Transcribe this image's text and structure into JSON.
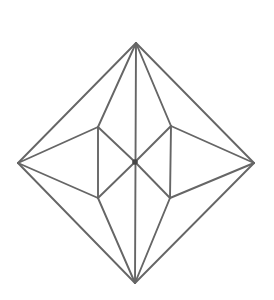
{
  "figure": {
    "type": "line-diagram",
    "canvas": {
      "width": 274,
      "height": 300,
      "background": "#ffffff"
    },
    "stroke": {
      "color": "#666666",
      "width": 1.9
    },
    "center_dot": {
      "at": "C",
      "radius": 2.8,
      "color": "#454545"
    },
    "vertices": {
      "T": [
        136,
        43
      ],
      "R": [
        254,
        163
      ],
      "B": [
        135,
        283
      ],
      "L": [
        18,
        163
      ],
      "C": [
        135,
        162
      ],
      "UL": [
        98,
        127
      ],
      "UR": [
        171,
        126
      ],
      "LL": [
        98,
        198
      ],
      "LR": [
        170,
        198
      ]
    },
    "edges": [
      [
        "T",
        "R"
      ],
      [
        "R",
        "B"
      ],
      [
        "B",
        "L"
      ],
      [
        "L",
        "T"
      ],
      [
        "T",
        "B"
      ],
      [
        "T",
        "UL"
      ],
      [
        "T",
        "UR"
      ],
      [
        "B",
        "LL"
      ],
      [
        "B",
        "LR"
      ],
      [
        "L",
        "UL"
      ],
      [
        "L",
        "LL"
      ],
      [
        "R",
        "UR"
      ],
      [
        "R",
        "LR"
      ],
      [
        "UL",
        "LL"
      ],
      [
        "UR",
        "LR"
      ],
      [
        "UL",
        "C"
      ],
      [
        "UR",
        "C"
      ],
      [
        "LL",
        "C"
      ],
      [
        "LR",
        "C"
      ]
    ]
  }
}
